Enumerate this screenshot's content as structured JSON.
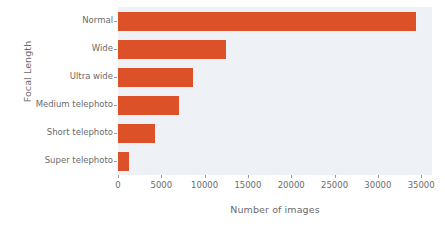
{
  "chart_data": {
    "type": "bar",
    "orientation": "horizontal",
    "title": "",
    "xlabel": "Number of images",
    "ylabel": "Focal Length",
    "categories": [
      "Normal",
      "Wide",
      "Ultra wide",
      "Medium telephoto",
      "Short telephoto",
      "Super telephoto"
    ],
    "values": [
      34400,
      12500,
      8650,
      7050,
      4250,
      1250
    ],
    "xlim": [
      0,
      36250
    ],
    "xticks": [
      0,
      5000,
      10000,
      15000,
      20000,
      25000,
      30000,
      35000
    ],
    "xticklabels": [
      "0",
      "5000",
      "10000",
      "15000",
      "20000",
      "25000",
      "30000",
      "35000"
    ],
    "grid": false,
    "legend": null,
    "bar_color": "#dd5129",
    "plot_background": "#eef1f5",
    "figure_background": "#ffffff",
    "tick_color": "#6b6b6b"
  }
}
